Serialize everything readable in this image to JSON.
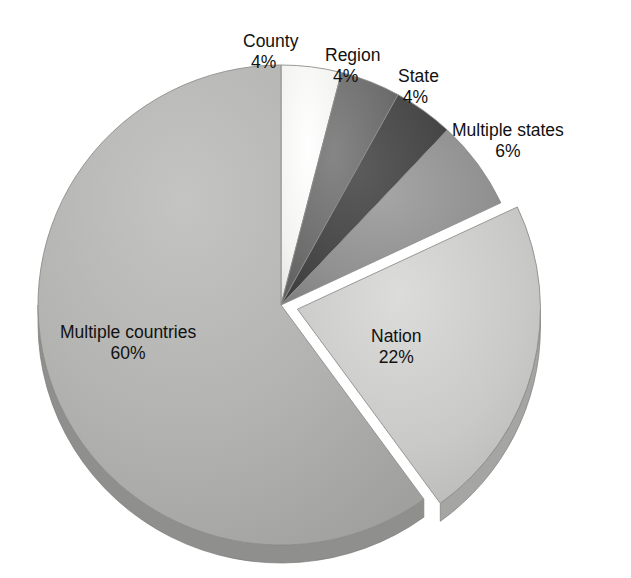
{
  "chart": {
    "title": "",
    "background": "#ffffff",
    "center": {
      "x": 281,
      "y": 305
    },
    "radius_x": 243,
    "radius_y": 240,
    "depth": 18,
    "label_text_color": "#111111"
  },
  "chart_data": {
    "type": "pie",
    "title": "",
    "xlabel": "",
    "ylabel": "",
    "grid": false,
    "legend_position": "none",
    "labels_position": "outside-and-inside",
    "start_angle_deg": 0,
    "direction": "clockwise",
    "exploded_slices": [
      "Nation"
    ],
    "categories": [
      "County",
      "Region",
      "State",
      "Multiple states",
      "Nation",
      "Multiple countries"
    ],
    "values": [
      4,
      4,
      4,
      6,
      22,
      60
    ],
    "value_suffix": "%",
    "colors": [
      "#f2f2f0",
      "#6d6d6d",
      "#474747",
      "#909090",
      "#c8c8c6",
      "#b2b2b0"
    ],
    "slices": [
      {
        "label": "County",
        "value": 4,
        "display_value": "4%",
        "color": "#f2f2f0",
        "side_color": "#cfcfcd",
        "exploded": false
      },
      {
        "label": "Region",
        "value": 4,
        "display_value": "4%",
        "color": "#6d6d6d",
        "side_color": "#565656",
        "exploded": false
      },
      {
        "label": "State",
        "value": 4,
        "display_value": "4%",
        "color": "#474747",
        "side_color": "#343434",
        "exploded": false
      },
      {
        "label": "Multiple states",
        "value": 6,
        "display_value": "6%",
        "color": "#909090",
        "side_color": "#737373",
        "exploded": false
      },
      {
        "label": "Nation",
        "value": 22,
        "display_value": "22%",
        "color": "#c8c8c6",
        "side_color": "#a5a5a3",
        "exploded": true
      },
      {
        "label": "Multiple countries",
        "value": 60,
        "display_value": "60%",
        "color": "#b2b2b0",
        "side_color": "#8f8f8d",
        "exploded": false
      }
    ]
  },
  "labels": {
    "county": {
      "name": "County",
      "value": "4%"
    },
    "region": {
      "name": "Region",
      "value": "4%"
    },
    "state": {
      "name": "State",
      "value": "4%"
    },
    "multiple_states": {
      "name": "Multiple states",
      "value": "6%"
    },
    "nation": {
      "name": "Nation",
      "value": "22%"
    },
    "multiple_countries": {
      "name": "Multiple countries",
      "value": "60%"
    }
  }
}
